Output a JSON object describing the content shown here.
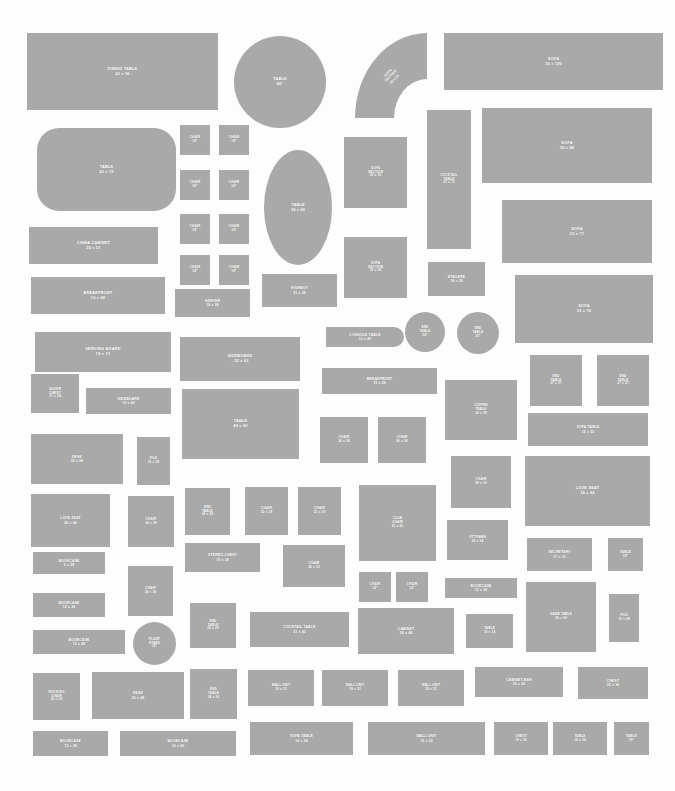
{
  "sheet": {
    "title": "Furniture Template Cutout Sheet",
    "background_color": "#fdfdfd",
    "piece_fill": "#a9a9a9",
    "label_color": "#ffffff",
    "width": 675,
    "height": 791
  },
  "pieces": [
    {
      "name": "DINING TABLE",
      "size": "42 x 96",
      "label": "DINING TABLE\n42 x 96",
      "x": 27,
      "y": 33,
      "w": 191,
      "h": 77,
      "shape": "rect",
      "text": "md"
    },
    {
      "name": "TABLE",
      "size": "48\"",
      "label": "TABLE\n48\"",
      "x": 234,
      "y": 36,
      "w": 92,
      "h": 92,
      "shape": "round",
      "text": "md"
    },
    {
      "name": "SOFA SECTION",
      "size": "33 x 33",
      "label": "SOFA\nSECTION\n33 x 33",
      "x": 355,
      "y": 33,
      "w": 72,
      "h": 85,
      "shape": "corner",
      "text": "xs"
    },
    {
      "name": "SOFA",
      "size": "30 x 100",
      "label": "SOFA\n30 x 100",
      "x": 444,
      "y": 33,
      "w": 219,
      "h": 57,
      "shape": "rect",
      "text": "md"
    },
    {
      "name": "TABLE",
      "size": "42 x 72",
      "label": "TABLE\n42 x 72",
      "x": 37,
      "y": 128,
      "w": 139,
      "h": 83,
      "shape": "rrect",
      "text": "md"
    },
    {
      "name": "CHAIR",
      "size": "18\"",
      "label": "CHAIR\n18\"",
      "x": 180,
      "y": 125,
      "w": 30,
      "h": 30,
      "shape": "rect",
      "text": "xs"
    },
    {
      "name": "CHAIR",
      "size": "18\"",
      "label": "CHAIR\n18\"",
      "x": 219,
      "y": 125,
      "w": 30,
      "h": 30,
      "shape": "rect",
      "text": "xs"
    },
    {
      "name": "CHAIR",
      "size": "18\"",
      "label": "CHAIR\n18\"",
      "x": 180,
      "y": 170,
      "w": 30,
      "h": 30,
      "shape": "rect",
      "text": "xs"
    },
    {
      "name": "CHAIR",
      "size": "18\"",
      "label": "CHAIR\n18\"",
      "x": 219,
      "y": 170,
      "w": 30,
      "h": 30,
      "shape": "rect",
      "text": "xs"
    },
    {
      "name": "CHAIR",
      "size": "18\"",
      "label": "CHAIR\n18\"",
      "x": 180,
      "y": 214,
      "w": 30,
      "h": 30,
      "shape": "rect",
      "text": "xs"
    },
    {
      "name": "CHAIR",
      "size": "18\"",
      "label": "CHAIR\n18\"",
      "x": 219,
      "y": 214,
      "w": 30,
      "h": 30,
      "shape": "rect",
      "text": "xs"
    },
    {
      "name": "CHAIR",
      "size": "18\"",
      "label": "CHAIR\n18\"",
      "x": 180,
      "y": 255,
      "w": 30,
      "h": 30,
      "shape": "rect",
      "text": "xs"
    },
    {
      "name": "CHAIR",
      "size": "18\"",
      "label": "CHAIR\n18\"",
      "x": 219,
      "y": 255,
      "w": 30,
      "h": 30,
      "shape": "rect",
      "text": "xs"
    },
    {
      "name": "TABLE",
      "size": "38 x 60",
      "label": "TABLE\n38 x 60",
      "x": 264,
      "y": 150,
      "w": 68,
      "h": 115,
      "shape": "oval",
      "text": "md"
    },
    {
      "name": "SOFA SECTION",
      "size": "33 x 36",
      "label": "SOFA\nSECTION\n33 x 36",
      "x": 344,
      "y": 137,
      "w": 63,
      "h": 71,
      "shape": "rect",
      "text": "xs"
    },
    {
      "name": "COCKTAIL TABLE",
      "size": "22 x 73",
      "label": "COCKTAIL\nTABLE\n22 x 73",
      "x": 427,
      "y": 110,
      "w": 44,
      "h": 139,
      "shape": "rect",
      "text": "xs"
    },
    {
      "name": "SOFA",
      "size": "38 x 88",
      "label": "SOFA\n38 x 88",
      "x": 482,
      "y": 108,
      "w": 170,
      "h": 75,
      "shape": "rect",
      "text": "md"
    },
    {
      "name": "CHINA CABINET",
      "size": "20 x 57",
      "label": "CHINA CABINET\n20 x 57",
      "x": 29,
      "y": 227,
      "w": 129,
      "h": 37,
      "shape": "rect",
      "text": "md"
    },
    {
      "name": "SOFA",
      "size": "33 x 77",
      "label": "SOFA\n33 x 77",
      "x": 502,
      "y": 200,
      "w": 150,
      "h": 63,
      "shape": "rect",
      "text": "md"
    },
    {
      "name": "SOFA SECTION",
      "size": "33 x 36",
      "label": "SOFA\nSECTION\n33 x 36",
      "x": 344,
      "y": 237,
      "w": 63,
      "h": 61,
      "shape": "rect",
      "text": "xs"
    },
    {
      "name": "HIGHBOY",
      "size": "21 x 38",
      "label": "HIGHBOY\n21 x 38",
      "x": 262,
      "y": 274,
      "w": 75,
      "h": 33,
      "shape": "rect",
      "text": "sm"
    },
    {
      "name": "BREAKFRONT",
      "size": "19 x 68",
      "label": "BREAKFRONT\n19 x 68",
      "x": 31,
      "y": 277,
      "w": 134,
      "h": 37,
      "shape": "rect",
      "text": "md"
    },
    {
      "name": "SERVER",
      "size": "18 x 58",
      "label": "SERVER\n18 x 58",
      "x": 175,
      "y": 289,
      "w": 75,
      "h": 28,
      "shape": "rect",
      "text": "sm"
    },
    {
      "name": "ETAGERE",
      "size": "18 x 39",
      "label": "ETAGERE\n18 x 39",
      "x": 428,
      "y": 262,
      "w": 57,
      "h": 34,
      "shape": "rect",
      "text": "sm"
    },
    {
      "name": "SOFA",
      "size": "32 x 70",
      "label": "SOFA\n32 x 70",
      "x": 515,
      "y": 275,
      "w": 138,
      "h": 68,
      "shape": "rect",
      "text": "md"
    },
    {
      "name": "SERVING BOARD",
      "size": "18 x 73",
      "label": "SERVING BOARD\n18 x 73",
      "x": 35,
      "y": 332,
      "w": 136,
      "h": 40,
      "shape": "rect",
      "text": "md"
    },
    {
      "name": "CONSOLE TABLE",
      "size": "13 x 42",
      "label": "CONSOLE TABLE\n13 x 42",
      "x": 326,
      "y": 327,
      "w": 78,
      "h": 20,
      "shape": "demilune",
      "text": "sm"
    },
    {
      "name": "END TABLE",
      "size": "24\"",
      "label": "END\nTABLE\n24\"",
      "x": 405,
      "y": 312,
      "w": 40,
      "h": 40,
      "shape": "round",
      "text": "xs"
    },
    {
      "name": "END TABLE",
      "size": "25\"",
      "label": "END\nTABLE\n25\"",
      "x": 457,
      "y": 312,
      "w": 42,
      "h": 42,
      "shape": "round",
      "text": "xs"
    },
    {
      "name": "SIDEBOARD",
      "size": "22 x 62",
      "label": "SIDEBOARD\n-  22 x 62",
      "x": 180,
      "y": 337,
      "w": 120,
      "h": 44,
      "shape": "rect",
      "text": "md"
    },
    {
      "name": "SILVER CHEST",
      "size": "17 x 24",
      "label": "SILVER\nCHEST\n17 x 24",
      "x": 31,
      "y": 374,
      "w": 48,
      "h": 39,
      "shape": "rect",
      "text": "xs"
    },
    {
      "name": "SIDEBOARD",
      "size": "19 x 43",
      "label": "SIDEBOARD\n19 x 43",
      "x": 86,
      "y": 388,
      "w": 85,
      "h": 26,
      "shape": "rect",
      "text": "sm"
    },
    {
      "name": "BREAKFRONT",
      "size": "19 x 58",
      "label": "BREAKFRONT\n19 x 58",
      "x": 322,
      "y": 368,
      "w": 115,
      "h": 26,
      "shape": "rect",
      "text": "sm"
    },
    {
      "name": "END TABLE",
      "size": "27 x 27",
      "label": "END\nTABLE\n27 x 27",
      "x": 530,
      "y": 355,
      "w": 52,
      "h": 51,
      "shape": "rect",
      "text": "xs"
    },
    {
      "name": "END TABLE",
      "size": "27 x 27",
      "label": "END\nTABLE\n27 x 27",
      "x": 597,
      "y": 355,
      "w": 52,
      "h": 51,
      "shape": "rect",
      "text": "xs"
    },
    {
      "name": "COFFEE TABLE",
      "size": "20 x 39",
      "label": "COFFEE\nTABLE\n20 x 39",
      "x": 445,
      "y": 380,
      "w": 72,
      "h": 60,
      "shape": "rect",
      "text": "xs"
    },
    {
      "name": "TABLE",
      "size": "48 x 60",
      "label": "TABLE\n48 x 60",
      "x": 182,
      "y": 389,
      "w": 117,
      "h": 70,
      "shape": "rect",
      "text": "md"
    },
    {
      "name": "SOFA TABLE",
      "size": "16 x 52",
      "label": "SOFA TABLE\n16 x 52",
      "x": 528,
      "y": 413,
      "w": 120,
      "h": 33,
      "shape": "rect",
      "text": "sm"
    },
    {
      "name": "DESK",
      "size": "33 x 66",
      "label": "DESK\n33 x 66",
      "x": 31,
      "y": 434,
      "w": 92,
      "h": 50,
      "shape": "rect",
      "text": "sm"
    },
    {
      "name": "FILE",
      "size": "15 x 28",
      "label": "FILE\n15 x 28",
      "x": 137,
      "y": 437,
      "w": 33,
      "h": 48,
      "shape": "rect",
      "text": "xs"
    },
    {
      "name": "CHAIR",
      "size": "26 x 28",
      "label": "CHAIR\n26 x 28",
      "x": 320,
      "y": 417,
      "w": 48,
      "h": 46,
      "shape": "rect",
      "text": "xs"
    },
    {
      "name": "CHAIR",
      "size": "26 x 28",
      "label": "CHAIR\n26 x 28",
      "x": 378,
      "y": 417,
      "w": 48,
      "h": 46,
      "shape": "rect",
      "text": "xs"
    },
    {
      "name": "CHAIR",
      "size": "28 x 33",
      "label": "CHAIR\n28 x 33",
      "x": 451,
      "y": 456,
      "w": 60,
      "h": 52,
      "shape": "rect",
      "text": "xs"
    },
    {
      "name": "LOVE SEAT",
      "size": "36 x 64",
      "label": "LOVE SEAT\n36 x 64",
      "x": 525,
      "y": 456,
      "w": 125,
      "h": 70,
      "shape": "rect",
      "text": "md"
    },
    {
      "name": "LOVE SEAT",
      "size": "25 x 44",
      "label": "LOVE SEAT\n25 x 44",
      "x": 31,
      "y": 494,
      "w": 79,
      "h": 53,
      "shape": "rect",
      "text": "sm"
    },
    {
      "name": "CHAIR",
      "size": "24 x 28",
      "label": "CHAIR\n24 x 28",
      "x": 128,
      "y": 496,
      "w": 46,
      "h": 51,
      "shape": "rect",
      "text": "xs"
    },
    {
      "name": "END TABLE",
      "size": "24 x 28",
      "label": "END\nTABLE\n24 x 28",
      "x": 185,
      "y": 488,
      "w": 45,
      "h": 47,
      "shape": "rect",
      "text": "xs"
    },
    {
      "name": "CHAIR",
      "size": "22 x 29",
      "label": "CHAIR\n22 x 29",
      "x": 245,
      "y": 487,
      "w": 43,
      "h": 48,
      "shape": "rect",
      "text": "xs"
    },
    {
      "name": "CHAIR",
      "size": "22 x 29",
      "label": "CHAIR\n22 x 29",
      "x": 298,
      "y": 487,
      "w": 43,
      "h": 48,
      "shape": "rect",
      "text": "xs"
    },
    {
      "name": "CLUB CHAIR",
      "size": "41 x 41",
      "label": "CLUB\nCHAIR\n41 x 41",
      "x": 359,
      "y": 485,
      "w": 77,
      "h": 76,
      "shape": "rect",
      "text": "xs"
    },
    {
      "name": "OTTOMAN",
      "size": "22 x 34",
      "label": "OTTOMAN\n22 x 34",
      "x": 447,
      "y": 520,
      "w": 61,
      "h": 40,
      "shape": "rect",
      "text": "xs"
    },
    {
      "name": "BOOKCASE",
      "size": "9 x 28",
      "label": "BOOKCASE\n9 x 28",
      "x": 33,
      "y": 552,
      "w": 72,
      "h": 22,
      "shape": "rect",
      "text": "sm"
    },
    {
      "name": "STEREO-CHEST",
      "size": "19 x 38",
      "label": "STEREO-CHEST\n19 x 38",
      "x": 185,
      "y": 543,
      "w": 75,
      "h": 29,
      "shape": "rect",
      "text": "sm"
    },
    {
      "name": "CHAIR",
      "size": "26 x 33",
      "label": "CHAIR\n26 x 33",
      "x": 283,
      "y": 545,
      "w": 62,
      "h": 42,
      "shape": "rect",
      "text": "xs"
    },
    {
      "name": "SECRETARY",
      "size": "17 x 33",
      "label": "SECRETARY\n17 x 33",
      "x": 527,
      "y": 538,
      "w": 65,
      "h": 33,
      "shape": "rect",
      "text": "sm"
    },
    {
      "name": "TABLE",
      "size": "18\"",
      "label": "TABLE\n18\"",
      "x": 608,
      "y": 538,
      "w": 35,
      "h": 33,
      "shape": "rect",
      "text": "xs"
    },
    {
      "name": "CHAIR",
      "size": "24 x 36",
      "label": "CHAIR\n24 x 36",
      "x": 128,
      "y": 566,
      "w": 45,
      "h": 50,
      "shape": "rect",
      "text": "xs"
    },
    {
      "name": "BOOKCASE",
      "size": "12 x 36",
      "label": "BOOKCASE\n12 x 36",
      "x": 33,
      "y": 593,
      "w": 72,
      "h": 24,
      "shape": "rect",
      "text": "sm"
    },
    {
      "name": "CHAIR",
      "size": "14\"",
      "label": "CHAIR\n14\"",
      "x": 359,
      "y": 572,
      "w": 32,
      "h": 30,
      "shape": "rect",
      "text": "xs"
    },
    {
      "name": "CHAIR",
      "size": "14\"",
      "label": "CHAIR\n14\"",
      "x": 396,
      "y": 572,
      "w": 32,
      "h": 30,
      "shape": "rect",
      "text": "xs"
    },
    {
      "name": "BOOKCASE",
      "size": "12 x 36",
      "label": "BOOKCASE\n12 x 36",
      "x": 445,
      "y": 578,
      "w": 72,
      "h": 20,
      "shape": "rect",
      "text": "sm"
    },
    {
      "name": "GAME TABLE",
      "size": "36 x 36",
      "label": "GAME TABLE\n36 x 36",
      "x": 526,
      "y": 582,
      "w": 70,
      "h": 70,
      "shape": "rect",
      "text": "xs"
    },
    {
      "name": "FILE",
      "size": "15 x 28",
      "label": "FILE\n15 x 28",
      "x": 609,
      "y": 594,
      "w": 30,
      "h": 48,
      "shape": "rect",
      "text": "xs"
    },
    {
      "name": "END TABLE",
      "size": "25 x 25",
      "label": "END\nTABLE\n25 x 25",
      "x": 190,
      "y": 603,
      "w": 46,
      "h": 45,
      "shape": "rect",
      "text": "xs"
    },
    {
      "name": "COCKTAIL TABLE",
      "size": "21 x 40",
      "label": "COCKTAIL TABLE\n21 x 40",
      "x": 250,
      "y": 612,
      "w": 99,
      "h": 35,
      "shape": "rect",
      "text": "sm"
    },
    {
      "name": "CABINET",
      "size": "24 x 48",
      "label": "CABINET\n24 x 48",
      "x": 358,
      "y": 608,
      "w": 96,
      "h": 46,
      "shape": "rect",
      "text": "sm"
    },
    {
      "name": "TABLE",
      "size": "18 x 24",
      "label": "TABLE\n18 x 24",
      "x": 466,
      "y": 614,
      "w": 47,
      "h": 34,
      "shape": "rect",
      "text": "xs"
    },
    {
      "name": "BOOKCASE",
      "size": "12 x 48",
      "label": "BOOKCASE\n12 x 48",
      "x": 33,
      "y": 630,
      "w": 92,
      "h": 24,
      "shape": "rect",
      "text": "sm"
    },
    {
      "name": "PLANT STAND",
      "size": "18\"",
      "label": "PLANT\nSTAND\n18\"",
      "x": 133,
      "y": 622,
      "w": 43,
      "h": 43,
      "shape": "round",
      "text": "xs"
    },
    {
      "name": "ROCKING CHAIR",
      "size": "20 x 25",
      "label": "ROCKING\nCHAIR\n20 x 25",
      "x": 33,
      "y": 673,
      "w": 47,
      "h": 47,
      "shape": "rect",
      "text": "xs"
    },
    {
      "name": "DESK",
      "size": "25 x 48",
      "label": "DESK\n25 x 48",
      "x": 92,
      "y": 672,
      "w": 92,
      "h": 47,
      "shape": "rect",
      "text": "sm"
    },
    {
      "name": "END TABLE",
      "size": "24 x 26",
      "label": "END\nTABLE\n24 x 26",
      "x": 190,
      "y": 669,
      "w": 47,
      "h": 50,
      "shape": "rect",
      "text": "xs"
    },
    {
      "name": "WALL UNIT",
      "size": "19 x 32",
      "label": "WALL UNIT\n19 x 32",
      "x": 248,
      "y": 670,
      "w": 66,
      "h": 36,
      "shape": "rect",
      "text": "xs"
    },
    {
      "name": "WALL UNIT",
      "size": "19 x 32",
      "label": "WALL UNIT\n19 x 32",
      "x": 322,
      "y": 670,
      "w": 66,
      "h": 36,
      "shape": "rect",
      "text": "xs"
    },
    {
      "name": "WALL UNIT",
      "size": "19 x 32",
      "label": "WALL UNIT\n19 x 32",
      "x": 398,
      "y": 670,
      "w": 66,
      "h": 36,
      "shape": "rect",
      "text": "xs"
    },
    {
      "name": "CABINET-BAR",
      "size": "20 x 40",
      "label": "CABINET-BAR\n20 x 40",
      "x": 475,
      "y": 667,
      "w": 88,
      "h": 30,
      "shape": "rect",
      "text": "sm"
    },
    {
      "name": "CHEST",
      "size": "18 x 36",
      "label": "CHEST\n18 x 36",
      "x": 578,
      "y": 667,
      "w": 70,
      "h": 32,
      "shape": "rect",
      "text": "sm"
    },
    {
      "name": "BOOKCASE",
      "size": "12 x 38",
      "label": "BOOKCASE\n12 x 38",
      "x": 33,
      "y": 731,
      "w": 75,
      "h": 25,
      "shape": "rect",
      "text": "sm"
    },
    {
      "name": "BOOKCASE",
      "size": "13 x 60",
      "label": "BOOKCASE\n13 x 60",
      "x": 120,
      "y": 731,
      "w": 116,
      "h": 25,
      "shape": "rect",
      "text": "sm"
    },
    {
      "name": "SOFA TABLE",
      "size": "16 x 54",
      "label": "SOFA TABLE\n16 x 54",
      "x": 250,
      "y": 722,
      "w": 103,
      "h": 33,
      "shape": "rect",
      "text": "sm"
    },
    {
      "name": "WALL UNIT",
      "size": "16 x 52",
      "label": "WALL UNIT\n16 x 52",
      "x": 368,
      "y": 722,
      "w": 117,
      "h": 33,
      "shape": "rect",
      "text": "sm"
    },
    {
      "name": "CHEST",
      "size": "18 x 36",
      "label": "CHEST\n18 x 36",
      "x": 494,
      "y": 722,
      "w": 54,
      "h": 33,
      "shape": "rect",
      "text": "xs"
    },
    {
      "name": "TABLE",
      "size": "18 x 24",
      "label": "TABLE\n18 x 24",
      "x": 553,
      "y": 722,
      "w": 54,
      "h": 33,
      "shape": "rect",
      "text": "xs"
    },
    {
      "name": "TABLE",
      "size": "18\"",
      "label": "TABLE\n18\"",
      "x": 614,
      "y": 722,
      "w": 35,
      "h": 33,
      "shape": "rect",
      "text": "xs"
    }
  ]
}
